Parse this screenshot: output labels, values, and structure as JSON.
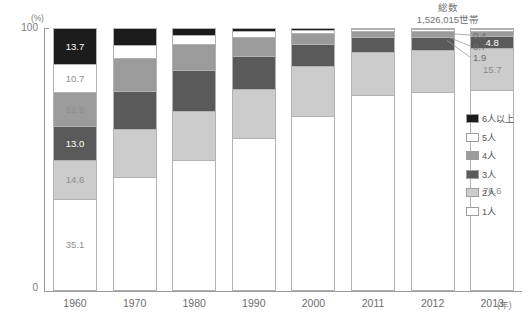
{
  "axes": {
    "y_unit": "(%)",
    "y_top": "100",
    "y_bottom": "0",
    "x_unit": "(年)"
  },
  "annotation": {
    "line1": "総数",
    "line2": "1,526,015世帯"
  },
  "legend": {
    "items": [
      {
        "label": "6人以上",
        "color": "#1c1c1c"
      },
      {
        "label": "5人",
        "color": "#ffffff"
      },
      {
        "label": "4人",
        "color": "#9b9b9b"
      },
      {
        "label": "3人",
        "color": "#5a5a5a"
      },
      {
        "label": "2人",
        "color": "#cccccc"
      },
      {
        "label": "1人",
        "color": "#ffffff"
      }
    ]
  },
  "callouts": [
    {
      "value": "0.4"
    },
    {
      "value": "0.7"
    },
    {
      "value": "1.9"
    }
  ],
  "chart_data": {
    "type": "bar",
    "subtype": "stacked-100-percent",
    "title": "",
    "xlabel": "(年)",
    "ylabel": "(%)",
    "ylim": [
      0,
      100
    ],
    "grid": false,
    "legend_position": "right",
    "categories": [
      "1960",
      "1970",
      "1980",
      "1990",
      "2000",
      "2011",
      "2012",
      "2013"
    ],
    "series": [
      {
        "name": "1人",
        "color": "#ffffff",
        "values": [
          35.1,
          43.5,
          50.0,
          58.0,
          66.5,
          74.5,
          75.5,
          76.6
        ]
      },
      {
        "name": "2人",
        "color": "#cccccc",
        "values": [
          14.6,
          18.0,
          18.5,
          19.0,
          19.0,
          16.5,
          16.0,
          15.7
        ]
      },
      {
        "name": "3人",
        "color": "#5a5a5a",
        "values": [
          13.0,
          14.5,
          15.5,
          12.5,
          8.5,
          5.6,
          5.2,
          4.8
        ]
      },
      {
        "name": "4人",
        "color": "#9b9b9b",
        "values": [
          12.9,
          12.5,
          10.0,
          7.0,
          4.0,
          2.3,
          2.1,
          1.9
        ]
      },
      {
        "name": "5人",
        "color": "#ffffff",
        "values": [
          10.7,
          5.0,
          3.5,
          2.5,
          1.4,
          0.8,
          0.8,
          0.7
        ]
      },
      {
        "name": "6人以上",
        "color": "#1c1c1c",
        "values": [
          13.7,
          6.5,
          2.5,
          1.0,
          0.6,
          0.3,
          0.4,
          0.3
        ]
      }
    ],
    "value_labels": {
      "1960": {
        "1人": "35.1",
        "2人": "14.6",
        "3人": "13.0",
        "4人": "12.9",
        "5人": "10.7",
        "6人以上": "13.7"
      },
      "2013": {
        "1人": "76.6",
        "2人": "15.7",
        "3人": "4.8",
        "4人": "1.9",
        "5人": "0.7",
        "6人以上": "0.4"
      }
    }
  }
}
